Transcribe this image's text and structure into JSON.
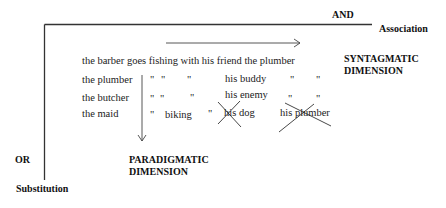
{
  "labels": {
    "and": "AND",
    "association": "Association",
    "or": "OR",
    "substitution": "Substitution",
    "syntagmatic": [
      "SYNTAGMATIC",
      "DIMENSION"
    ],
    "paradigmatic": [
      "PARADIGMATIC",
      "DIMENSION"
    ]
  },
  "sentence": "the barber goes fishing with his friend the plumber",
  "rows": [
    {
      "subject": "the plumber",
      "cells": [
        "\"",
        "\"",
        "\"",
        "his buddy",
        "\"",
        "\""
      ]
    },
    {
      "subject": "the butcher",
      "cells": [
        "\"",
        "\"",
        "\"",
        "his enemy",
        "\"",
        "\""
      ]
    },
    {
      "subject": "the maid",
      "cells": [
        "\"",
        "biking",
        "\"",
        "his dog",
        "his plumber"
      ]
    }
  ],
  "crossed_out": [
    "his dog",
    "his plumber"
  ],
  "colors": {
    "ink": "#222222",
    "background": "#ffffff"
  }
}
